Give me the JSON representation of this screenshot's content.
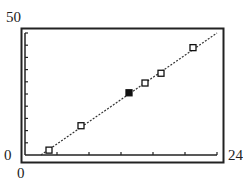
{
  "chart_data": {
    "type": "scatter",
    "title": "",
    "xlabel": "",
    "ylabel": "",
    "xlim": [
      0,
      24
    ],
    "ylim": [
      0,
      50
    ],
    "x_tick_step": 4,
    "y_tick_step": 5,
    "grid": false,
    "legend": null,
    "axis_labels": {
      "x_min": "0",
      "x_max": "24",
      "y_min": "0",
      "y_max": "50"
    },
    "series": [
      {
        "name": "data",
        "marker": "open-square",
        "points": [
          {
            "x": 3,
            "y": 2
          },
          {
            "x": 7,
            "y": 12
          },
          {
            "x": 13,
            "y": 25.5,
            "filled": true
          },
          {
            "x": 15,
            "y": 29.5
          },
          {
            "x": 17,
            "y": 33.5
          },
          {
            "x": 21,
            "y": 44
          }
        ]
      }
    ],
    "fit_line": {
      "style": "dotted",
      "x0": 2,
      "y0": 0,
      "x1": 24,
      "y1": 50
    }
  }
}
